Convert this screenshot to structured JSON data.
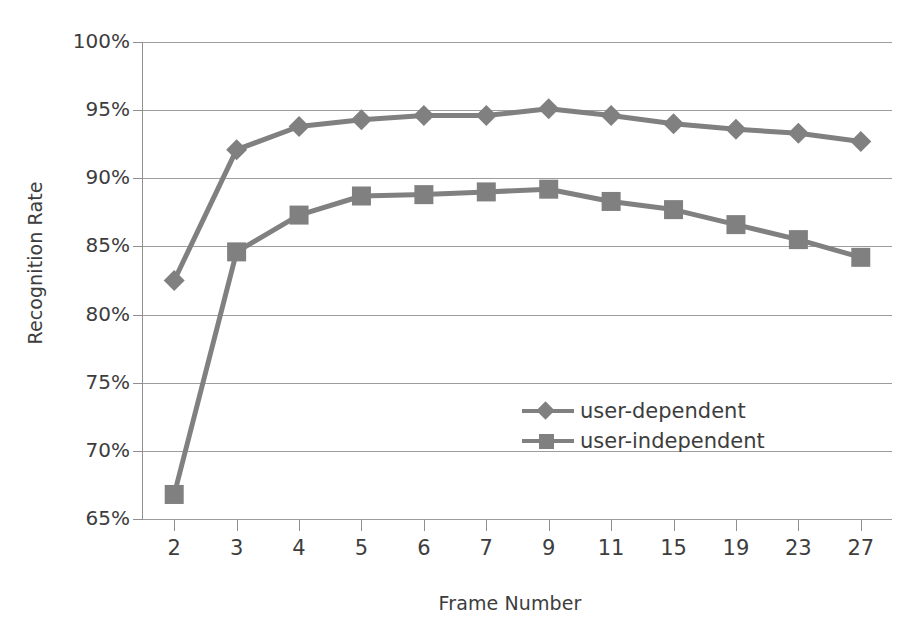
{
  "chart_data": {
    "type": "line",
    "title": "",
    "xlabel": "Frame Number",
    "ylabel": "Recognition Rate",
    "categories": [
      "2",
      "3",
      "4",
      "5",
      "6",
      "7",
      "9",
      "11",
      "15",
      "19",
      "23",
      "27"
    ],
    "series": [
      {
        "name": "user-dependent",
        "marker": "diamond",
        "color": "#808080",
        "values": [
          82.5,
          92.1,
          93.8,
          94.3,
          94.6,
          94.6,
          95.1,
          94.6,
          94.0,
          93.6,
          93.3,
          92.7
        ]
      },
      {
        "name": "user-independent",
        "marker": "square",
        "color": "#808080",
        "values": [
          66.8,
          84.6,
          87.3,
          88.7,
          88.8,
          89.0,
          89.2,
          88.3,
          87.7,
          86.6,
          85.5,
          84.2
        ]
      }
    ],
    "ylim": [
      65,
      100
    ],
    "ytick_values": [
      100,
      95,
      90,
      85,
      80,
      75,
      70,
      65
    ],
    "ytick_labels": [
      "100%",
      "95%",
      "90%",
      "85%",
      "80%",
      "75%",
      "70%",
      "65%"
    ],
    "grid": true,
    "legend_position": "inside-center-right",
    "value_suffix": "%"
  },
  "legend": {
    "entries": [
      {
        "label": "user-dependent"
      },
      {
        "label": "user-independent"
      }
    ]
  },
  "colors": {
    "series_gray": "#808080",
    "gridline": "#9d9d9d",
    "axis": "#8f8f8f",
    "text": "#3d3d3d",
    "background": "#ffffff"
  }
}
